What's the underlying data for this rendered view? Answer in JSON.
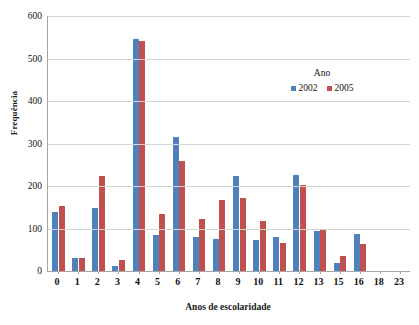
{
  "chart_data": {
    "type": "bar",
    "title": "",
    "xlabel": "Anos de escolaridade",
    "ylabel": "Frequência",
    "categories": [
      "0",
      "1",
      "2",
      "3",
      "4",
      "5",
      "6",
      "7",
      "8",
      "9",
      "10",
      "11",
      "12",
      "13",
      "15",
      "16",
      "18",
      "23"
    ],
    "series": [
      {
        "name": "2002",
        "color": "#4F81BD",
        "values": [
          140,
          31,
          148,
          12,
          545,
          84,
          316,
          80,
          76,
          224,
          72,
          79,
          225,
          95,
          18,
          88,
          0,
          0
        ]
      },
      {
        "name": "2005",
        "color": "#C0504D",
        "values": [
          152,
          30,
          223,
          27,
          541,
          133,
          260,
          122,
          167,
          172,
          117,
          66,
          203,
          98,
          35,
          63,
          0,
          0
        ]
      }
    ],
    "ylim": [
      0,
      600
    ],
    "yticks": [
      0,
      100,
      200,
      300,
      400,
      500,
      600
    ],
    "grid": true,
    "legend": {
      "title": "Ano",
      "position": "inside-upper-right",
      "entries": [
        "2002",
        "2005"
      ]
    }
  },
  "colors": {
    "series_2002": "#4F81BD",
    "series_2005": "#C0504D",
    "gridline": "#d4d4d4",
    "axis": "#a6a6a6",
    "text": "#111111",
    "background": "#ffffff"
  }
}
